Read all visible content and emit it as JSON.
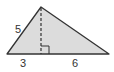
{
  "diagram": {
    "type": "triangle-with-altitude",
    "colors": {
      "fill": "#dcdcdc",
      "stroke": "#333333",
      "label": "#333333"
    },
    "labels": {
      "left_side": "5",
      "base_left_segment": "3",
      "base_right_segment": "6"
    },
    "features": [
      "dashed-altitude",
      "right-angle-marker"
    ]
  }
}
